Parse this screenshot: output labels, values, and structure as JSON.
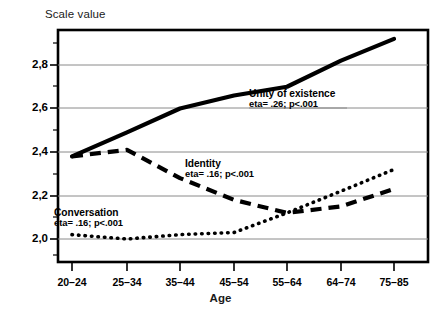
{
  "chart_data": {
    "type": "line",
    "title": "",
    "ylabel": "Scale value",
    "xlabel": "Age",
    "categories": [
      "20–24",
      "25–34",
      "35–44",
      "45–54",
      "55–64",
      "64–74",
      "75–85"
    ],
    "ytick_labels": [
      "2,0",
      "2,2",
      "2,4",
      "2,6",
      "2,8"
    ],
    "yticks": [
      2.0,
      2.2,
      2.4,
      2.6,
      2.8
    ],
    "ylim": [
      1.93,
      2.97
    ],
    "grid": "horizontal",
    "legend": "inline-annotations",
    "series": [
      {
        "name": "Unity of existence",
        "style": "solid",
        "annotation": "eta= .26; p<.001",
        "eta": ".26",
        "p": "p<.001",
        "values": [
          2.38,
          2.49,
          2.6,
          2.66,
          2.7,
          2.82,
          2.92
        ]
      },
      {
        "name": "Identity",
        "style": "dashed",
        "annotation": "eta= .16; p<.001",
        "eta": ".16",
        "p": "p<.001",
        "values": [
          2.38,
          2.41,
          2.28,
          2.18,
          2.12,
          2.15,
          2.23
        ]
      },
      {
        "name": "Conversation",
        "style": "dotted",
        "annotation": "eta= .16; p<.001",
        "eta": ".16",
        "p": "p<.001",
        "values": [
          2.02,
          2.0,
          2.02,
          2.03,
          2.12,
          2.22,
          2.32
        ]
      }
    ]
  },
  "annotations": {
    "unity": {
      "name": "Unity of existence",
      "stat": "eta= .26; p<.001"
    },
    "identity": {
      "name": "Identity",
      "stat": "eta= .16; p<.001"
    },
    "conversation": {
      "name": "Conversation",
      "stat": "eta= .16; p<.001"
    }
  },
  "axes": {
    "y_title": "Scale value",
    "x_title": "Age"
  }
}
